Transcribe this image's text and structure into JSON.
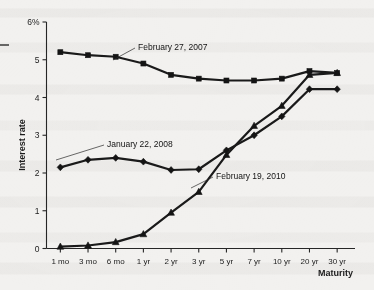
{
  "chart_data": {
    "type": "line",
    "title": "",
    "xlabel": "Maturity",
    "ylabel": "Interest rate",
    "ylim": [
      0,
      6
    ],
    "yticks": [
      0,
      1,
      2,
      3,
      4,
      5,
      6
    ],
    "ytick_labels": [
      "0",
      "1",
      "2",
      "3",
      "4",
      "5",
      "6%"
    ],
    "grid": false,
    "legend_position": "inline-annotations",
    "categories": [
      "1 mo",
      "3 mo",
      "6 mo",
      "1 yr",
      "2 yr",
      "3 yr",
      "5 yr",
      "7 yr",
      "10 yr",
      "20 yr",
      "30 yr"
    ],
    "series": [
      {
        "name": "February 27, 2007",
        "marker": "square",
        "values": [
          5.2,
          5.12,
          5.08,
          4.9,
          4.6,
          4.5,
          4.45,
          4.45,
          4.5,
          4.7,
          4.65
        ]
      },
      {
        "name": "January 22, 2008",
        "marker": "diamond",
        "values": [
          2.15,
          2.35,
          2.4,
          2.3,
          2.08,
          2.1,
          2.6,
          3.0,
          3.5,
          4.22,
          4.22
        ]
      },
      {
        "name": "February 19, 2010",
        "marker": "triangle",
        "values": [
          0.05,
          0.08,
          0.17,
          0.38,
          0.95,
          1.5,
          2.48,
          3.25,
          3.78,
          4.6,
          4.65
        ]
      }
    ],
    "annotations": [
      {
        "label": "February 27, 2007",
        "attached_series": "February 27, 2007"
      },
      {
        "label": "January 22, 2008",
        "attached_series": "January 22, 2008"
      },
      {
        "label": "February 19, 2010",
        "attached_series": "February 19, 2010"
      }
    ]
  }
}
